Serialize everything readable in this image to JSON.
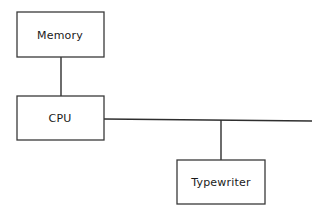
{
  "diagram": {
    "background_color": "#ffffff",
    "line_color": "#2e2e2e",
    "box_stroke_color": "#3a3a3a",
    "box_fill_color": "#ffffff",
    "text_color": "#1a1a1a",
    "nodes": [
      {
        "id": "memory",
        "label": "Memory",
        "x": 17,
        "y": 12,
        "width": 87,
        "height": 45,
        "label_x": 60,
        "label_y": 35
      },
      {
        "id": "cpu",
        "label": "CPU",
        "x": 17,
        "y": 96,
        "width": 87,
        "height": 44,
        "label_x": 60,
        "label_y": 118
      },
      {
        "id": "typewriter",
        "label": "Typewriter",
        "x": 177,
        "y": 160,
        "width": 88,
        "height": 44,
        "label_x": 221,
        "label_y": 182
      }
    ],
    "connections": [
      {
        "id": "memory-to-cpu",
        "from": "memory",
        "to": "cpu",
        "orientation": "vertical",
        "x1": 61,
        "y1": 57,
        "x2": 61,
        "y2": 96
      },
      {
        "id": "cpu-to-bus",
        "from": "cpu",
        "to": "bus",
        "orientation": "horizontal",
        "x1": 104,
        "y1": 119,
        "x2": 312,
        "y2": 121
      },
      {
        "id": "bus-to-typewriter",
        "from": "bus",
        "to": "typewriter",
        "orientation": "vertical",
        "x1": 221,
        "y1": 120,
        "x2": 221,
        "y2": 160
      }
    ]
  }
}
